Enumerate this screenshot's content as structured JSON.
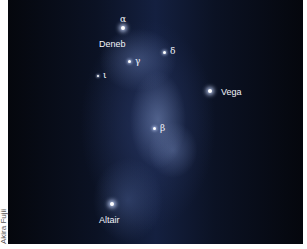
{
  "image": {
    "description": "Night-sky photograph of the Milky Way showing the Summer Triangle stars with labels",
    "background_color": "#0b1224",
    "milky_way_color": "#7888b8"
  },
  "stars": [
    {
      "id": "deneb",
      "name": "Deneb",
      "greek": "α",
      "x": 123,
      "y": 33,
      "size": "bright"
    },
    {
      "id": "vega",
      "name": "Vega",
      "greek": "",
      "x": 210,
      "y": 92,
      "size": "bright"
    },
    {
      "id": "altair",
      "name": "Altair",
      "greek": "",
      "x": 112,
      "y": 205,
      "size": "bright"
    },
    {
      "id": "gamma",
      "name": "",
      "greek": "γ",
      "x": 128,
      "y": 61,
      "size": "mid"
    },
    {
      "id": "delta",
      "name": "",
      "greek": "δ",
      "x": 164,
      "y": 52,
      "size": "mid"
    },
    {
      "id": "iota",
      "name": "",
      "greek": "ι",
      "x": 98,
      "y": 75,
      "size": "faint"
    },
    {
      "id": "beta",
      "name": "",
      "greek": "β",
      "x": 154,
      "y": 128,
      "size": "mid"
    }
  ],
  "labels": {
    "alpha": "α",
    "deneb": "Deneb",
    "gamma": "γ",
    "delta": "δ",
    "iota": "ι",
    "vega": "Vega",
    "beta": "β",
    "altair": "Altair"
  },
  "credit": "Akira Fujii"
}
